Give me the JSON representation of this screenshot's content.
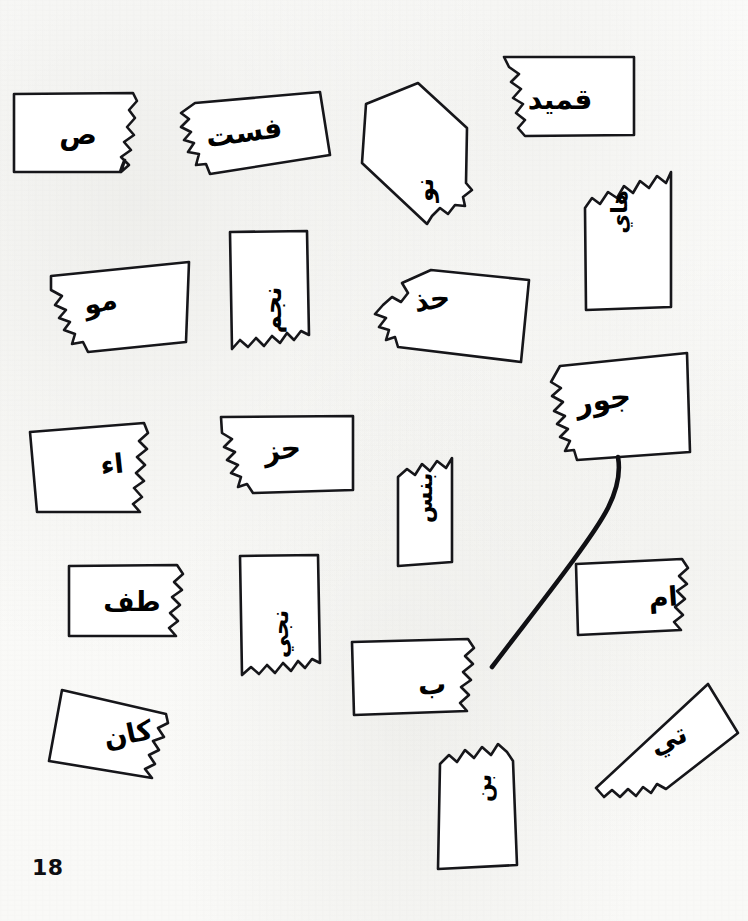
{
  "page": {
    "number": "18",
    "background_color": "#fbfbf9",
    "ink_color": "#16161a"
  },
  "river": {
    "name": "river-line",
    "path": "M 618 457 C 624 492, 600 524, 572 562 C 544 600, 520 630, 492 667"
  },
  "shapes": [
    {
      "id": "shape-1",
      "label": "ص",
      "label_x": 78,
      "label_y": 135,
      "label_size": 28,
      "label_rotate": 0,
      "path": "M 14 94 L 133 93 L 137 101 L 129 110 L 135 118 L 127 127 L 134 135 L 124 142 L 131 150 L 121 157 L 129 165 L 121 172 L 125 160 L 124 161 L 122 166 L 120 172 L 14 172 Z"
    },
    {
      "id": "shape-2",
      "label": "فست",
      "label_x": 244,
      "label_y": 133,
      "label_size": 28,
      "label_rotate": -8,
      "path": "M 195 103 L 320 92 L 330 155 L 210 174 L 206 164 L 196 165 L 199 154 L 188 152 L 194 143 L 184 140 L 191 132 L 181 127 L 189 119 L 181 113 Z"
    },
    {
      "id": "shape-3",
      "label": "نو",
      "label_x": 425,
      "label_y": 190,
      "label_size": 24,
      "label_rotate": -90,
      "path": "M 418 83 L 467 128 L 466 183 L 472 190 L 463 197 L 465 206 L 455 205 L 448 214 L 440 208 L 432 216 L 427 224 L 362 163 L 366 104 Z"
    },
    {
      "id": "shape-4",
      "label": "قميد",
      "label_x": 560,
      "label_y": 100,
      "label_size": 28,
      "label_rotate": 0,
      "path": "M 504 57 L 634 57 L 634 135 L 525 136 L 518 128 L 525 120 L 516 113 L 523 104 L 513 98 L 521 89 L 511 82 L 519 74 L 509 67 Z"
    },
    {
      "id": "shape-5",
      "label": "هاي",
      "label_x": 620,
      "label_y": 212,
      "label_size": 22,
      "label_rotate": -90,
      "path": "M 585 208 L 592 198 L 600 204 L 608 192 L 617 198 L 624 186 L 633 193 L 640 181 L 649 188 L 657 176 L 666 183 L 671 172 L 671 307 L 586 310 Z"
    },
    {
      "id": "shape-6",
      "label": "مو",
      "label_x": 100,
      "label_y": 302,
      "label_size": 27,
      "label_rotate": -13,
      "path": "M 189 262 L 186 342 L 88 352 L 83 342 L 72 344 L 75 334 L 64 330 L 70 322 L 59 318 L 66 310 L 55 305 L 62 296 L 51 290 L 51 276 Z"
    },
    {
      "id": "shape-7",
      "label": "نجم",
      "label_x": 272,
      "label_y": 310,
      "label_size": 25,
      "label_rotate": -90,
      "path": "M 230 232 L 307 231 L 309 335 L 301 331 L 294 340 L 287 333 L 280 343 L 272 336 L 264 346 L 256 338 L 248 347 L 240 340 L 232 349 Z"
    },
    {
      "id": "shape-8",
      "label": "حذ",
      "label_x": 432,
      "label_y": 300,
      "label_size": 28,
      "label_rotate": -10,
      "path": "M 431 270 L 529 280 L 521 362 L 398 347 L 395 337 L 386 340 L 389 330 L 379 327 L 386 318 L 375 314 L 383 305 L 392 297 L 401 302 L 408 293 L 402 283 Z"
    },
    {
      "id": "shape-9",
      "label": "جور",
      "label_x": 603,
      "label_y": 400,
      "label_size": 29,
      "label_rotate": -9,
      "path": "M 560 366 L 687 353 L 690 452 L 577 460 L 574 450 L 565 451 L 570 441 L 560 437 L 568 429 L 557 424 L 565 416 L 554 411 L 563 402 L 552 396 L 561 388 L 551 382 Z"
    },
    {
      "id": "shape-10",
      "label": "اء",
      "label_x": 112,
      "label_y": 464,
      "label_size": 27,
      "label_rotate": -6,
      "path": "M 30 432 L 144 423 L 148 433 L 139 441 L 147 449 L 137 457 L 145 465 L 136 473 L 144 481 L 134 488 L 142 497 L 133 504 L 140 512 L 37 512 Z"
    },
    {
      "id": "shape-11",
      "label": "حز",
      "label_x": 282,
      "label_y": 450,
      "label_size": 28,
      "label_rotate": -8,
      "path": "M 221 417 L 353 416 L 353 490 L 253 493 L 247 484 L 238 487 L 241 477 L 231 473 L 238 465 L 227 460 L 235 452 L 224 447 L 232 439 L 222 433 Z"
    },
    {
      "id": "shape-12",
      "label": "بنس",
      "label_x": 424,
      "label_y": 498,
      "label_size": 23,
      "label_rotate": -90,
      "path": "M 398 477 L 407 469 L 415 475 L 422 464 L 430 471 L 437 461 L 446 468 L 452 458 L 452 562 L 398 566 Z"
    },
    {
      "id": "shape-13",
      "label": "طف",
      "label_x": 132,
      "label_y": 601,
      "label_size": 27,
      "label_rotate": 0,
      "path": "M 69 566 L 177 565 L 183 574 L 174 582 L 182 590 L 172 597 L 180 605 L 170 613 L 178 621 L 169 628 L 176 636 L 69 636 Z"
    },
    {
      "id": "shape-14",
      "label": "نجي",
      "label_x": 280,
      "label_y": 634,
      "label_size": 23,
      "label_rotate": -90,
      "path": "M 240 556 L 318 555 L 320 663 L 312 659 L 305 668 L 298 661 L 291 671 L 283 663 L 275 673 L 267 665 L 259 674 L 251 667 L 242 675 Z"
    },
    {
      "id": "shape-15",
      "label": "ام",
      "label_x": 663,
      "label_y": 597,
      "label_size": 27,
      "label_rotate": -4,
      "path": "M 576 564 L 682 559 L 688 568 L 679 576 L 687 584 L 677 591 L 685 599 L 675 607 L 683 615 L 674 622 L 681 630 L 578 635 Z"
    },
    {
      "id": "shape-16",
      "label": "ب",
      "label_x": 432,
      "label_y": 685,
      "label_size": 28,
      "label_rotate": -3,
      "path": "M 352 642 L 468 639 L 474 648 L 465 656 L 473 664 L 463 672 L 471 680 L 461 687 L 469 695 L 460 703 L 467 711 L 354 715 Z"
    },
    {
      "id": "shape-17",
      "label": "كان",
      "label_x": 128,
      "label_y": 734,
      "label_size": 27,
      "label_rotate": -12,
      "path": "M 62 690 L 166 714 L 168 723 L 158 728 L 164 737 L 153 741 L 159 750 L 149 755 L 155 764 L 145 769 L 152 778 L 49 761 Z"
    },
    {
      "id": "shape-18",
      "label": "تي",
      "label_x": 668,
      "label_y": 739,
      "label_size": 27,
      "label_rotate": -24,
      "path": "M 708 684 L 738 733 L 666 789 L 657 784 L 651 793 L 643 787 L 636 796 L 628 789 L 620 797 L 612 790 L 604 797 L 596 788 Z"
    },
    {
      "id": "shape-19",
      "label": "بن",
      "label_x": 484,
      "label_y": 788,
      "label_size": 22,
      "label_rotate": -90,
      "path": "M 440 764 L 449 755 L 457 762 L 465 750 L 474 758 L 482 747 L 491 755 L 498 744 L 507 752 L 513 761 L 517 865 L 438 869 Z"
    }
  ]
}
